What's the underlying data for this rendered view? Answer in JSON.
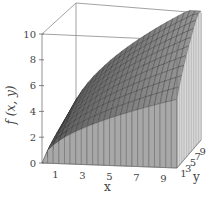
{
  "chart_data": {
    "type": "surface3d",
    "title": "",
    "xlabel": "x",
    "ylabel": "y",
    "zlabel": "f (x, y)",
    "x_ticks": [
      "1",
      "3",
      "5",
      "7",
      "9"
    ],
    "y_ticks": [
      "1",
      "3",
      "5",
      "7",
      "9"
    ],
    "z_ticks": [
      "0",
      "2",
      "4",
      "6",
      "8",
      "10"
    ],
    "xlim": [
      0,
      10
    ],
    "ylim": [
      0,
      10
    ],
    "zlim": [
      0,
      10
    ],
    "grid": false,
    "legend": null,
    "surface_description": "Grey meshed surface rising from 0 at the x=0 edge, increasing concavely in x and slightly in y, reaching ~10 at x=10,y=10 (approx f = sqrt(x*y)-like)",
    "surface_samples": {
      "x": [
        0,
        2,
        4,
        6,
        8,
        10
      ],
      "y_front": [
        0,
        3.2,
        5.0,
        6.3,
        7.4,
        8.4
      ],
      "y_back": [
        0,
        4.5,
        6.3,
        7.8,
        9.0,
        10.0
      ]
    },
    "colors": {
      "surface": "#6e6e6e",
      "mesh": "#2a2a2a",
      "box": "#777777"
    }
  }
}
